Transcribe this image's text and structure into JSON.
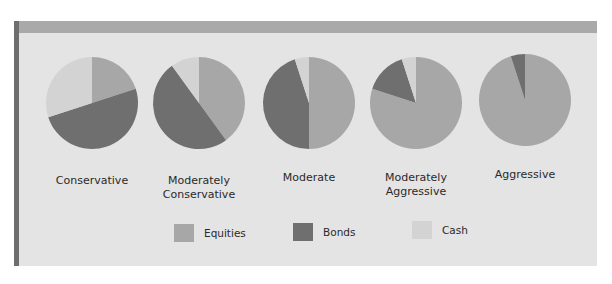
{
  "chart_data": {
    "type": "pie",
    "title": "",
    "legend": {
      "position": "bottom",
      "entries": [
        "Equities",
        "Bonds",
        "Cash"
      ]
    },
    "colors": {
      "Equities": "#a7a7a7",
      "Bonds": "#6f6f6f",
      "Cash": "#d3d3d3"
    },
    "categories": [
      "Equities",
      "Bonds",
      "Cash"
    ],
    "pies": [
      {
        "name": "Conservative",
        "label_lines": [
          "Conservative"
        ],
        "values": [
          20,
          50,
          30
        ]
      },
      {
        "name": "Moderately Conservative",
        "label_lines": [
          "Moderately",
          "Conservative"
        ],
        "values": [
          40,
          50,
          10
        ]
      },
      {
        "name": "Moderate",
        "label_lines": [
          "Moderate"
        ],
        "values": [
          50,
          45,
          5
        ]
      },
      {
        "name": "Moderately Aggressive",
        "label_lines": [
          "Moderately",
          "Aggressive"
        ],
        "values": [
          80,
          15,
          5
        ]
      },
      {
        "name": "Aggressive",
        "label_lines": [
          "Aggressive"
        ],
        "values": [
          95,
          5,
          0
        ]
      }
    ]
  },
  "labels": {
    "p0": {
      "l1": "Conservative",
      "l2": ""
    },
    "p1": {
      "l1": "Moderately",
      "l2": "Conservative"
    },
    "p2": {
      "l1": "Moderate",
      "l2": ""
    },
    "p3": {
      "l1": "Moderately",
      "l2": "Aggressive"
    },
    "p4": {
      "l1": "Aggressive",
      "l2": ""
    }
  },
  "legend": {
    "equities": "Equities",
    "bonds": "Bonds",
    "cash": "Cash"
  }
}
